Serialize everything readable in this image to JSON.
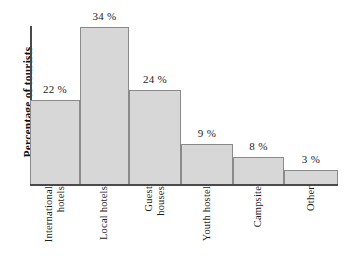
{
  "chart_data": {
    "type": "bar",
    "title": "",
    "xlabel": "",
    "ylabel": "Percentage of tourists",
    "categories": [
      "International hotels",
      "Local hotels",
      "Guest houses",
      "Youth hostel",
      "Campsite",
      "Other"
    ],
    "category_lines": [
      [
        "International",
        "hotels"
      ],
      [
        "Local hotels"
      ],
      [
        "Guest",
        "houses"
      ],
      [
        "Youth hostel"
      ],
      [
        "Campsite"
      ],
      [
        "Other"
      ]
    ],
    "values": [
      22,
      34,
      24,
      9,
      8,
      3
    ],
    "value_labels": [
      "22 %",
      "34 %",
      "24 %",
      "9 %",
      "8 %",
      "3 %"
    ],
    "unit": "%",
    "ylim": [
      0,
      36
    ],
    "grid": false,
    "legend": null,
    "axis_ticks_visible": false,
    "colors": {
      "bar_fill": "#d7d7d7",
      "bar_stroke": "#8a8a8a",
      "axis": "#4a4a4a",
      "text": "#1c1c1c",
      "background": "#ffffff"
    },
    "geometry": {
      "baseline_y": 184,
      "axis_left_x": 30,
      "axis_right_x": 338,
      "bar_edges_x": [
        30,
        80,
        129,
        181,
        233,
        284,
        338
      ],
      "bar_tops_y": [
        100,
        27,
        90,
        144,
        157,
        170
      ]
    }
  }
}
